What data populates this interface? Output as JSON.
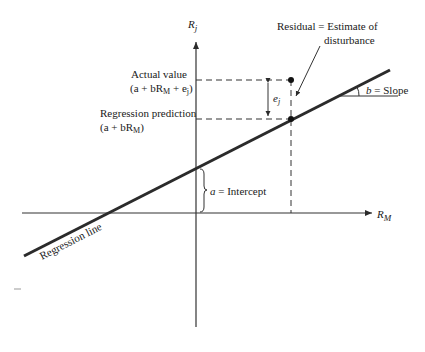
{
  "diagram": {
    "type": "regression-line-diagram",
    "axes": {
      "y_label_main": "R",
      "y_label_sub": "j",
      "x_label_main": "R",
      "x_label_sub": "M"
    },
    "labels": {
      "residual_line1": "Residual = Estimate of",
      "residual_line2": "disturbance",
      "actual_line1": "Actual value",
      "actual_line2_pre": "(a + bR",
      "actual_line2_sub": "M",
      "actual_line2_post": " + e",
      "actual_line2_sub2": "j",
      "actual_line2_end": ")",
      "prediction_line1": "Regression prediction",
      "prediction_line2_pre": "(a + bR",
      "prediction_line2_sub": "M",
      "prediction_line2_end": ")",
      "error_main": "e",
      "error_sub": "j",
      "slope_var": "b",
      "slope_text": " = Slope",
      "intercept_var": "a",
      "intercept_text": " = Intercept",
      "regression_line": "Regression line"
    },
    "colors": {
      "line": "#2b2b2b",
      "text": "#1a1a1a",
      "background": "#ffffff"
    }
  }
}
